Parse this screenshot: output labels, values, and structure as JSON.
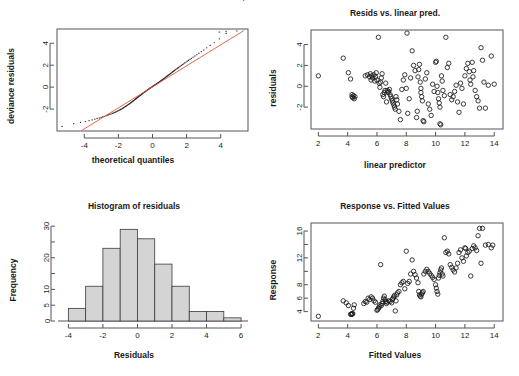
{
  "figure": {
    "name": "glm-diagnostic-plots",
    "panel_count": 4,
    "background": "#ffffff"
  },
  "chart_data": [
    {
      "id": "qq-plot",
      "type": "scatter",
      "title": "",
      "xlabel": "theoretical quantiles",
      "ylabel": "deviance residuals",
      "xlim": [
        -5.6,
        5.6
      ],
      "ylim": [
        -4.0,
        5.3
      ],
      "xticks": [
        -4,
        -2,
        0,
        2,
        4
      ],
      "yticks": [
        -2,
        0,
        2,
        4
      ],
      "grid": false,
      "point_style": "small-dot",
      "reference_line": {
        "color": "#e8553a",
        "x": [
          -4.15,
          5.35
        ],
        "y": [
          -3.95,
          5.15
        ],
        "label": "qq reference line"
      },
      "x": [
        -5.3,
        -4.62,
        -4.22,
        -3.94,
        -3.72,
        -3.54,
        -3.38,
        -3.25,
        -3.12,
        -3.01,
        -2.91,
        -2.82,
        -2.73,
        -2.65,
        -2.57,
        -2.5,
        -2.43,
        -2.36,
        -2.3,
        -2.24,
        -2.18,
        -2.13,
        -2.07,
        -2.02,
        -1.97,
        -1.92,
        -1.87,
        -1.83,
        -1.78,
        -1.74,
        -1.7,
        -1.66,
        -1.62,
        -1.58,
        -1.54,
        -1.5,
        -1.46,
        -1.43,
        -1.39,
        -1.35,
        -1.32,
        -1.28,
        -1.25,
        -1.22,
        -1.18,
        -1.15,
        -1.12,
        -1.08,
        -1.05,
        -1.02,
        -0.99,
        -0.96,
        -0.93,
        -0.9,
        -0.87,
        -0.84,
        -0.81,
        -0.78,
        -0.75,
        -0.72,
        -0.69,
        -0.66,
        -0.63,
        -0.6,
        -0.58,
        -0.55,
        -0.52,
        -0.49,
        -0.46,
        -0.43,
        -0.41,
        -0.38,
        -0.35,
        -0.32,
        -0.3,
        -0.27,
        -0.24,
        -0.21,
        -0.19,
        -0.16,
        -0.13,
        -0.1,
        -0.08,
        -0.05,
        -0.02,
        0.0,
        0.03,
        0.06,
        0.09,
        0.11,
        0.14,
        0.17,
        0.2,
        0.23,
        0.25,
        0.28,
        0.31,
        0.34,
        0.37,
        0.4,
        0.43,
        0.46,
        0.49,
        0.52,
        0.55,
        0.58,
        0.61,
        0.64,
        0.67,
        0.71,
        0.74,
        0.77,
        0.81,
        0.84,
        0.88,
        0.91,
        0.95,
        0.99,
        1.03,
        1.07,
        1.11,
        1.15,
        1.19,
        1.23,
        1.28,
        1.32,
        1.37,
        1.42,
        1.47,
        1.52,
        1.58,
        1.63,
        1.69,
        1.75,
        1.82,
        1.89,
        1.96,
        2.03,
        2.11,
        2.2,
        2.29,
        2.38,
        2.49,
        2.6,
        2.72,
        2.86,
        3.01,
        3.18,
        3.38,
        3.62,
        3.92,
        4.32,
        4.95,
        5.35
      ],
      "y": [
        -3.58,
        -3.33,
        -3.22,
        -3.14,
        -3.06,
        -2.99,
        -2.92,
        -2.86,
        -2.81,
        -2.76,
        -2.7,
        -2.66,
        -2.61,
        -2.56,
        -2.52,
        -2.48,
        -2.44,
        -2.4,
        -2.36,
        -2.32,
        -2.28,
        -2.24,
        -2.2,
        -2.16,
        -2.12,
        -2.08,
        -2.04,
        -2.0,
        -1.96,
        -1.92,
        -1.88,
        -1.84,
        -1.8,
        -1.76,
        -1.72,
        -1.68,
        -1.64,
        -1.6,
        -1.56,
        -1.52,
        -1.48,
        -1.44,
        -1.4,
        -1.36,
        -1.32,
        -1.28,
        -1.24,
        -1.2,
        -1.16,
        -1.12,
        -1.08,
        -1.05,
        -1.01,
        -0.97,
        -0.93,
        -0.9,
        -0.86,
        -0.82,
        -0.79,
        -0.75,
        -0.72,
        -0.68,
        -0.64,
        -0.61,
        -0.57,
        -0.54,
        -0.5,
        -0.47,
        -0.44,
        -0.41,
        -0.38,
        -0.35,
        -0.32,
        -0.29,
        -0.26,
        -0.23,
        -0.2,
        -0.17,
        -0.14,
        -0.11,
        -0.08,
        -0.06,
        -0.03,
        0.0,
        0.03,
        0.06,
        0.09,
        0.11,
        0.14,
        0.17,
        0.2,
        0.23,
        0.26,
        0.29,
        0.32,
        0.35,
        0.38,
        0.41,
        0.44,
        0.47,
        0.51,
        0.54,
        0.57,
        0.61,
        0.64,
        0.68,
        0.71,
        0.75,
        0.79,
        0.83,
        0.87,
        0.91,
        0.95,
        0.99,
        1.03,
        1.07,
        1.11,
        1.16,
        1.2,
        1.25,
        1.3,
        1.35,
        1.4,
        1.45,
        1.5,
        1.56,
        1.61,
        1.67,
        1.73,
        1.79,
        1.85,
        1.92,
        1.98,
        2.05,
        2.12,
        2.2,
        2.28,
        2.36,
        2.45,
        2.54,
        2.63,
        2.73,
        2.84,
        2.96,
        3.09,
        3.23,
        3.39,
        3.58,
        3.8,
        4.06,
        4.4,
        4.9,
        5.12
      ],
      "highlight_points": {
        "color": "#5f7f9f",
        "x": [
          3.92,
          4.32
        ],
        "y": [
          5.02,
          5.08
        ]
      }
    },
    {
      "id": "resids-vs-linear-pred",
      "type": "scatter",
      "title": "Resids vs. linear pred.",
      "xlabel": "linear predictor",
      "ylabel": "residuals",
      "xlim": [
        1.5,
        14.6
      ],
      "ylim": [
        -4.1,
        5.4
      ],
      "xticks": [
        2,
        4,
        6,
        8,
        10,
        12,
        14
      ],
      "yticks": [
        -2,
        0,
        2,
        4
      ],
      "grid": false,
      "point_style": "open-circle",
      "x": [
        2.0,
        3.7,
        4.05,
        4.2,
        4.3,
        4.3,
        4.35,
        4.4,
        4.45,
        4.5,
        5.2,
        5.35,
        5.5,
        5.55,
        5.6,
        5.65,
        5.7,
        5.8,
        5.85,
        5.9,
        5.95,
        6.0,
        6.1,
        6.15,
        6.2,
        6.25,
        6.3,
        6.35,
        6.4,
        6.45,
        6.5,
        6.55,
        6.6,
        6.65,
        6.7,
        6.75,
        6.8,
        6.85,
        6.9,
        6.95,
        7.0,
        7.05,
        7.1,
        7.15,
        7.2,
        7.25,
        7.3,
        7.35,
        7.4,
        7.5,
        7.6,
        7.7,
        7.8,
        7.9,
        8.0,
        8.05,
        8.1,
        8.2,
        8.3,
        8.4,
        8.5,
        8.6,
        8.7,
        8.75,
        8.8,
        8.85,
        8.9,
        8.95,
        9.0,
        9.0,
        9.05,
        9.1,
        9.15,
        9.2,
        9.3,
        9.4,
        9.5,
        9.6,
        9.7,
        9.8,
        9.9,
        10.0,
        10.05,
        10.1,
        10.15,
        10.2,
        10.25,
        10.3,
        10.3,
        10.35,
        10.4,
        10.45,
        10.5,
        10.6,
        10.7,
        10.8,
        10.9,
        11.0,
        11.1,
        11.2,
        11.3,
        11.4,
        11.5,
        11.6,
        11.7,
        11.8,
        11.9,
        12.0,
        12.1,
        12.2,
        12.3,
        12.35,
        12.4,
        12.5,
        12.55,
        12.6,
        12.7,
        12.8,
        12.9,
        13.0,
        13.1,
        13.2,
        13.3,
        13.4,
        13.6,
        13.8,
        14.0
      ],
      "y": [
        1.0,
        2.7,
        1.3,
        0.7,
        -0.8,
        -1.0,
        -1.1,
        -0.9,
        -1.2,
        -1.0,
        1.0,
        1.1,
        0.9,
        1.2,
        0.6,
        1.0,
        0.8,
        1.1,
        0.5,
        0.9,
        1.3,
        0.6,
        4.7,
        0.3,
        -0.1,
        0.4,
        0.8,
        1.2,
        -0.8,
        -1.0,
        -0.6,
        -0.4,
        0.3,
        -1.5,
        -0.4,
        -0.6,
        -0.5,
        -0.3,
        -0.8,
        -1.0,
        -1.2,
        -1.4,
        -1.6,
        -1.8,
        -2.0,
        -2.2,
        -1.0,
        -1.3,
        -1.7,
        -2.4,
        -3.2,
        -0.3,
        0.6,
        1.1,
        -0.2,
        5.1,
        -2.6,
        -1.2,
        0.8,
        3.4,
        2.0,
        1.5,
        -3.0,
        -2.4,
        0.9,
        1.6,
        2.1,
        0.4,
        -0.2,
        -0.6,
        -1.0,
        -1.4,
        -3.3,
        -3.4,
        0.7,
        1.3,
        -1.7,
        -2.2,
        -2.8,
        0.2,
        -0.5,
        2.3,
        2.4,
        0.0,
        -0.6,
        -1.2,
        -1.6,
        -2.0,
        -3.6,
        -3.7,
        1.0,
        0.5,
        -0.4,
        -0.9,
        4.7,
        1.8,
        2.2,
        -0.8,
        -1.3,
        -1.0,
        -0.5,
        0.1,
        -1.5,
        -2.5,
        0.3,
        -0.2,
        -1.7,
        1.0,
        1.7,
        2.2,
        1.4,
        0.6,
        0.2,
        2.3,
        0.9,
        1.5,
        -0.4,
        -1.0,
        -1.4,
        -2.1,
        3.7,
        2.5,
        0.4,
        -2.1,
        0.1,
        2.9,
        0.2
      ]
    },
    {
      "id": "histogram-of-residuals",
      "type": "bar",
      "title": "Histogram of residuals",
      "xlabel": "Residuals",
      "ylabel": "Frequency",
      "xlim": [
        -4.6,
        6.4
      ],
      "ylim": [
        0,
        31
      ],
      "xticks": [
        -4,
        -2,
        0,
        2,
        4,
        6
      ],
      "yticks": [
        0,
        5,
        10,
        15,
        20,
        25,
        30
      ],
      "ytick_labels": [
        "0",
        "5",
        "10",
        "",
        "20",
        "",
        "30"
      ],
      "grid": false,
      "bin_edges": [
        -4,
        -3,
        -2,
        -1,
        0,
        1,
        2,
        3,
        4,
        5,
        6
      ],
      "categories": [
        "-4 to -3",
        "-3 to -2",
        "-2 to -1",
        "-1 to 0",
        "0 to 1",
        "1 to 2",
        "2 to 3",
        "3 to 4",
        "4 to 5",
        "5 to 6"
      ],
      "values": [
        4,
        11,
        23,
        29,
        26,
        18,
        11,
        3,
        3,
        1
      ],
      "bar_fill": "#d4d4d4",
      "bar_stroke": "#3a3a3a"
    },
    {
      "id": "response-vs-fitted",
      "type": "scatter",
      "title": "Response vs. Fitted Values",
      "xlabel": "Fitted Values",
      "ylabel": "Response",
      "xlim": [
        1.5,
        14.6
      ],
      "ylim": [
        2.6,
        17.2
      ],
      "xticks": [
        2,
        4,
        6,
        8,
        10,
        12,
        14
      ],
      "yticks": [
        4,
        6,
        8,
        10,
        12,
        14,
        16
      ],
      "ytick_labels": [
        "4",
        "6",
        "8",
        "",
        "12",
        "",
        "16"
      ],
      "grid": false,
      "point_style": "open-circle",
      "x": [
        2.0,
        3.7,
        3.9,
        4.05,
        4.2,
        4.25,
        4.3,
        4.3,
        4.35,
        4.4,
        4.45,
        5.1,
        5.2,
        5.3,
        5.4,
        5.5,
        5.6,
        5.7,
        5.8,
        5.9,
        6.0,
        6.05,
        6.1,
        6.15,
        6.2,
        6.25,
        6.3,
        6.35,
        6.4,
        6.45,
        6.5,
        6.55,
        6.6,
        6.65,
        6.7,
        6.8,
        6.9,
        7.0,
        7.05,
        7.1,
        7.15,
        7.2,
        7.25,
        7.3,
        7.35,
        7.4,
        7.5,
        7.6,
        7.7,
        7.8,
        7.9,
        8.0,
        8.1,
        8.2,
        8.3,
        8.4,
        8.5,
        8.6,
        8.7,
        8.8,
        8.85,
        8.9,
        8.95,
        9.0,
        9.05,
        9.1,
        9.15,
        9.2,
        9.3,
        9.4,
        9.5,
        9.6,
        9.7,
        9.8,
        9.9,
        10.0,
        10.05,
        10.1,
        10.15,
        10.2,
        10.25,
        10.3,
        10.35,
        10.4,
        10.45,
        10.5,
        10.6,
        10.7,
        10.8,
        10.9,
        11.0,
        11.1,
        11.2,
        11.3,
        11.4,
        11.5,
        11.6,
        11.7,
        11.8,
        11.9,
        12.0,
        12.05,
        12.1,
        12.2,
        12.3,
        12.4,
        12.5,
        12.6,
        12.7,
        12.8,
        12.9,
        13.0,
        13.1,
        13.2,
        13.4,
        13.6,
        13.8,
        13.9
      ],
      "y": [
        3.3,
        5.6,
        5.3,
        4.9,
        3.6,
        3.6,
        3.6,
        3.7,
        3.7,
        4.5,
        5.0,
        5.2,
        5.5,
        5.4,
        6.0,
        5.8,
        6.2,
        6.0,
        5.6,
        5.4,
        4.2,
        4.3,
        4.5,
        4.7,
        5.0,
        11.0,
        4.9,
        5.2,
        5.5,
        6.0,
        6.3,
        5.8,
        5.5,
        5.2,
        5.4,
        5.6,
        5.5,
        5.3,
        5.8,
        6.0,
        6.2,
        6.4,
        4.1,
        5.6,
        6.5,
        6.8,
        7.0,
        8.0,
        8.3,
        8.5,
        7.4,
        13.0,
        8.2,
        8.5,
        9.6,
        11.7,
        10.0,
        9.5,
        9.0,
        8.3,
        7.0,
        6.5,
        6.3,
        6.2,
        6.6,
        6.8,
        7.0,
        9.6,
        10.0,
        10.3,
        10.0,
        9.7,
        9.4,
        9.1,
        8.8,
        8.0,
        7.5,
        7.0,
        6.6,
        9.0,
        9.4,
        9.8,
        10.2,
        10.5,
        9.6,
        9.3,
        15.0,
        12.8,
        13.0,
        12.6,
        11.0,
        10.6,
        10.2,
        9.9,
        10.5,
        11.2,
        12.8,
        13.2,
        12.0,
        11.5,
        13.5,
        13.4,
        12.3,
        12.8,
        13.0,
        9.3,
        13.4,
        13.8,
        13.5,
        13.1,
        15.3,
        16.4,
        11.2,
        16.4,
        13.9,
        14.0,
        13.5,
        13.9
      ]
    }
  ]
}
